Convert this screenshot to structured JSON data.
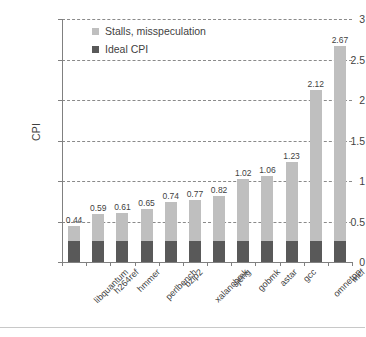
{
  "chart_data": {
    "type": "bar",
    "title": "",
    "subtitle": "",
    "xlabel": "",
    "ylabel": "CPI",
    "ylim": [
      0,
      3
    ],
    "ytick_labels": [
      "0",
      "0.5",
      "1",
      "1.5",
      "2",
      "2.5",
      "3"
    ],
    "ytick_values": [
      0,
      0.5,
      1,
      1.5,
      2,
      2.5,
      3
    ],
    "grid": true,
    "grid_style": "dashed-horizontal",
    "legend_position": "top-left-inside",
    "stacked": true,
    "categories": [
      "libquantum",
      "h264ref",
      "hmmer",
      "perlbench",
      "bzip2",
      "xalancbmk",
      "sjeng",
      "gobmk",
      "astar",
      "gcc",
      "omnetpp",
      "mcf"
    ],
    "series": [
      {
        "name": "Ideal CPI",
        "color": "#595959",
        "values": [
          0.26,
          0.26,
          0.26,
          0.26,
          0.26,
          0.26,
          0.26,
          0.26,
          0.26,
          0.26,
          0.26,
          0.26
        ]
      },
      {
        "name": "Stalls, misspeculation",
        "color": "#bfbfbf",
        "values": [
          0.18,
          0.33,
          0.35,
          0.39,
          0.48,
          0.51,
          0.56,
          0.76,
          0.8,
          0.97,
          1.86,
          2.41
        ]
      }
    ],
    "totals": [
      0.44,
      0.59,
      0.61,
      0.65,
      0.74,
      0.77,
      0.82,
      1.02,
      1.06,
      1.23,
      2.12,
      2.67
    ],
    "data_labels": [
      "0.44",
      "0.59",
      "0.61",
      "0.65",
      "0.74",
      "0.77",
      "0.82",
      "1.02",
      "1.06",
      "1.23",
      "2.12",
      "2.67"
    ]
  },
  "legend": {
    "items": [
      {
        "label": "Stalls, misspeculation",
        "color": "#bfbfbf"
      },
      {
        "label": "Ideal CPI",
        "color": "#595959"
      }
    ]
  },
  "axes": {
    "y_title": "CPI"
  }
}
